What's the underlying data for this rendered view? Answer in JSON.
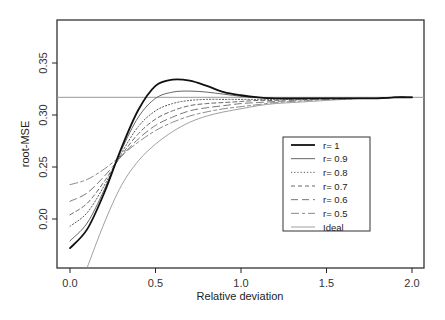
{
  "chart_data": {
    "type": "line",
    "title": "",
    "xlabel": "Relative deviation",
    "ylabel": "root-MSE",
    "xlim": [
      -0.05,
      2.07
    ],
    "ylim": [
      0.153,
      0.388
    ],
    "xticks": [
      0.0,
      0.5,
      1.0,
      1.5,
      2.0
    ],
    "xtick_labels": [
      "0.0",
      "0.5",
      "1.0",
      "1.5",
      "2.0"
    ],
    "yticks": [
      0.2,
      0.25,
      0.3,
      0.35
    ],
    "ytick_labels": [
      "0.20",
      "0.25",
      "0.30",
      "0.35"
    ],
    "grid": false,
    "legend_position": "inside-right",
    "reference_line": {
      "y": 0.317,
      "color": "#999999",
      "label": ""
    },
    "x": [
      0.0,
      0.1,
      0.2,
      0.3,
      0.4,
      0.5,
      0.6,
      0.7,
      0.8,
      0.9,
      1.0,
      1.1,
      1.2,
      1.3,
      1.4,
      1.5,
      1.6,
      1.7,
      1.8,
      1.9,
      2.0
    ],
    "series": [
      {
        "name": "r= 1",
        "style": "solid",
        "width": 1.8,
        "color": "#111111",
        "values": [
          0.172,
          0.19,
          0.225,
          0.268,
          0.305,
          0.328,
          0.334,
          0.333,
          0.328,
          0.322,
          0.319,
          0.317,
          0.316,
          0.316,
          0.316,
          0.316,
          0.316,
          0.316,
          0.316,
          0.317,
          0.317
        ]
      },
      {
        "name": "r= 0.9",
        "style": "solid",
        "width": 0.9,
        "color": "#555555",
        "values": [
          0.179,
          0.196,
          0.228,
          0.266,
          0.298,
          0.316,
          0.322,
          0.323,
          0.322,
          0.32,
          0.318,
          0.317,
          0.316,
          0.316,
          0.316,
          0.316,
          0.316,
          0.316,
          0.316,
          0.317,
          0.317
        ]
      },
      {
        "name": "r= 0.8",
        "style": "dotted",
        "width": 1.0,
        "color": "#555555",
        "values": [
          0.193,
          0.206,
          0.232,
          0.263,
          0.289,
          0.304,
          0.311,
          0.314,
          0.315,
          0.315,
          0.315,
          0.315,
          0.315,
          0.315,
          0.316,
          0.316,
          0.316,
          0.316,
          0.316,
          0.317,
          0.317
        ]
      },
      {
        "name": "r= 0.7",
        "style": "dashed",
        "width": 1.0,
        "color": "#666666",
        "values": [
          0.204,
          0.215,
          0.236,
          0.261,
          0.282,
          0.296,
          0.304,
          0.309,
          0.311,
          0.312,
          0.313,
          0.314,
          0.314,
          0.315,
          0.315,
          0.316,
          0.316,
          0.316,
          0.316,
          0.317,
          0.317
        ]
      },
      {
        "name": "r= 0.6",
        "style": "longdash",
        "width": 1.0,
        "color": "#777777",
        "values": [
          0.217,
          0.225,
          0.241,
          0.26,
          0.277,
          0.29,
          0.298,
          0.304,
          0.307,
          0.309,
          0.311,
          0.312,
          0.313,
          0.314,
          0.315,
          0.315,
          0.316,
          0.316,
          0.316,
          0.317,
          0.317
        ]
      },
      {
        "name": "r= 0.5",
        "style": "twodash",
        "width": 1.0,
        "color": "#888888",
        "values": [
          0.233,
          0.238,
          0.248,
          0.261,
          0.274,
          0.285,
          0.293,
          0.299,
          0.303,
          0.306,
          0.308,
          0.31,
          0.312,
          0.313,
          0.314,
          0.315,
          0.315,
          0.316,
          0.316,
          0.317,
          0.317
        ]
      },
      {
        "name": "Ideal",
        "style": "solid",
        "width": 0.8,
        "color": "#888888",
        "values": [
          null,
          0.153,
          0.196,
          0.232,
          0.256,
          0.272,
          0.284,
          0.293,
          0.299,
          0.303,
          0.306,
          0.309,
          0.311,
          0.312,
          0.313,
          0.314,
          0.315,
          0.316,
          0.316,
          0.317,
          0.317
        ]
      }
    ]
  },
  "layout": {
    "plot_box": {
      "left": 57,
      "top": 20,
      "right": 424,
      "bottom": 268
    },
    "x_map": {
      "px0": 70,
      "px_per_unit": 171
    },
    "y_map": {
      "v0": 0.3,
      "px_at_v0": 115,
      "px_per_unit": 1040
    },
    "legend_box": {
      "left": 283,
      "top": 137,
      "right": 370,
      "bottom": 231
    }
  }
}
